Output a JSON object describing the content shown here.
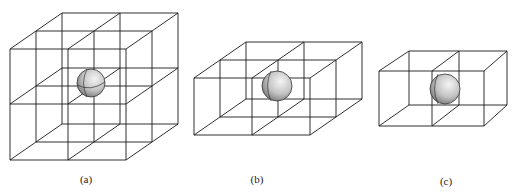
{
  "figures": [
    {
      "id": "a",
      "label": "(a)",
      "description": "2x2x2 grid of cubes with sphere at center"
    },
    {
      "id": "b",
      "label": "(b)",
      "description": "2x2x1 grid of cubes with sphere at center of shared edge"
    },
    {
      "id": "c",
      "label": "(c)",
      "description": "2x1x1 pair of cubes with sphere at center of shared face"
    }
  ],
  "colors": {
    "line": "#1a1a1a",
    "sphere_light": "#f0f0f0",
    "sphere_dark": "#7a7a7a",
    "background": "#ffffff"
  }
}
